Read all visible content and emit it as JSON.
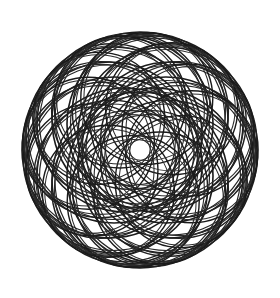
{
  "artwork": {
    "title": "Rosette Spirograph",
    "kind": "geometric-line-art",
    "description": "Symmetric rosette formed by many overlapping circles of equal radius whose centers lie on a small circle, producing a dense star at the middle and a scalloped petal outline.",
    "background_color": "#ffffff",
    "stroke_color": "#1c1c1c",
    "stroke_color_secondary": "#2e2e2e",
    "stroke_width": 1.55,
    "stroke_width_secondary": 1.15,
    "canvas": {
      "width": 280,
      "height": 298
    }
  },
  "chart_data": {
    "type": "scatter",
    "xlabel": "",
    "ylabel": "",
    "grid": false,
    "legend": false,
    "center": {
      "x": 140,
      "y": 150
    },
    "bounds": {
      "left": 23,
      "top": 22,
      "right": 258,
      "bottom": 278
    },
    "families": [
      {
        "name": "outer-ring-12",
        "count": 12,
        "radius": 88,
        "offset_radius": 30,
        "phase_deg": 0,
        "stroke": "#1c1c1c",
        "stroke_width": 1.6
      },
      {
        "name": "outer-ring-12-shadow",
        "count": 12,
        "radius": 85,
        "offset_radius": 31,
        "phase_deg": 0,
        "stroke": "#262626",
        "stroke_width": 1.2
      },
      {
        "name": "mid-ring-12",
        "count": 12,
        "radius": 78,
        "offset_radius": 40,
        "phase_deg": 15,
        "stroke": "#202020",
        "stroke_width": 1.45
      },
      {
        "name": "mid-ring-12-shadow",
        "count": 12,
        "radius": 75,
        "offset_radius": 41,
        "phase_deg": 15,
        "stroke": "#2a2a2a",
        "stroke_width": 1.1
      },
      {
        "name": "inner-ring-12",
        "count": 12,
        "radius": 66,
        "offset_radius": 52,
        "phase_deg": 7.5,
        "stroke": "#1a1a1a",
        "stroke_width": 1.4
      },
      {
        "name": "inner-ring-12-shadow",
        "count": 12,
        "radius": 63,
        "offset_radius": 53,
        "phase_deg": 7.5,
        "stroke": "#2c2c2c",
        "stroke_width": 1.05
      }
    ],
    "x": [],
    "values": [],
    "categories": []
  }
}
